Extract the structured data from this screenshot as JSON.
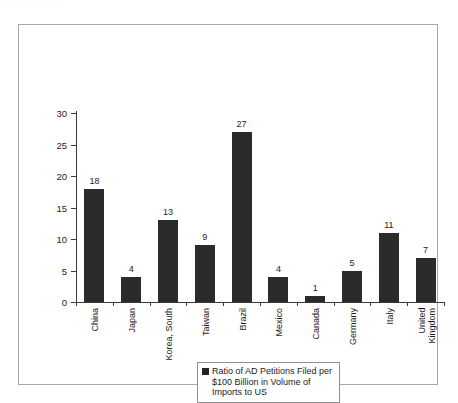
{
  "scan_artifact_text": ". . .   .   .         .  .   .",
  "legend": {
    "label": "Ratio of AD Petitions Filed per $100 Billion in Volume of Imports to US",
    "swatch_color": "#222222",
    "marker_icon": "filled-square-icon"
  },
  "axes": {
    "y_ticks": [
      "0",
      "5",
      "10",
      "15",
      "20",
      "25",
      "30"
    ],
    "y_min": 0,
    "y_max": 30,
    "y_step": 5
  },
  "colors": {
    "bar_fill": "#2b2b2b",
    "axis": "#3a3a3a",
    "frame_border": "#a8a8a8",
    "legend_border": "#8f8f8f",
    "text": "#1c1c1c",
    "background": "#ffffff"
  },
  "chart_data": {
    "type": "bar",
    "title": "",
    "xlabel": "",
    "ylabel": "",
    "ylim": [
      0,
      30
    ],
    "ytick_step": 5,
    "grid": false,
    "legend_position": "bottom-center",
    "categories": [
      "China",
      "Japan",
      "Korea, South",
      "Taiwan",
      "Brazil",
      "Mexico",
      "Canada",
      "Germany",
      "Italy",
      "United Kingdom"
    ],
    "category_label_lines": [
      [
        "China"
      ],
      [
        "Japan"
      ],
      [
        "Korea, South"
      ],
      [
        "Taiwan"
      ],
      [
        "Brazil"
      ],
      [
        "Mexico"
      ],
      [
        "Canada"
      ],
      [
        "Germany"
      ],
      [
        "Italy"
      ],
      [
        "United",
        "Kingdom"
      ]
    ],
    "values": [
      18,
      4,
      13,
      9,
      27,
      4,
      1,
      5,
      11,
      7
    ],
    "data_labels": [
      "18",
      "4",
      "13",
      "9",
      "27",
      "4",
      "1",
      "5",
      "11",
      "7"
    ],
    "series": [
      {
        "name": "Ratio of AD Petitions Filed per $100 Billion in Volume of Imports to US",
        "values": [
          18,
          4,
          13,
          9,
          27,
          4,
          1,
          5,
          11,
          7
        ]
      }
    ]
  }
}
